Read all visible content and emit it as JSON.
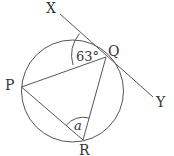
{
  "diagram": {
    "type": "circle-geometry",
    "points": {
      "X": "X",
      "Y": "Y",
      "P": "P",
      "Q": "Q",
      "R": "R"
    },
    "angles": {
      "XQP": "63°",
      "PRQ": "a"
    },
    "colors": {
      "stroke": "#555555",
      "text": "#333333",
      "background": "#ffffff"
    }
  }
}
